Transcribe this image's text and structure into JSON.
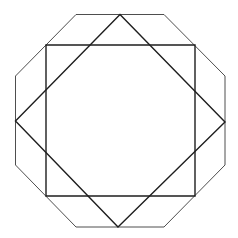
{
  "diagram": {
    "width": 238,
    "height": 238,
    "colors": {
      "background": "#ffffff",
      "outline": "#3a3a3a",
      "squares": "#1e1e1e"
    },
    "shapes": [
      {
        "name": "octagon",
        "points": "76,14.5 164,14.5 225,76 225,165 164,227 76,227 15.5,165 15.5,76"
      },
      {
        "name": "square",
        "points": "46,45 195,45 195,196 46,196"
      },
      {
        "name": "diamond",
        "points": "120,14.5 225,122 118,227 15.5,121"
      }
    ]
  }
}
